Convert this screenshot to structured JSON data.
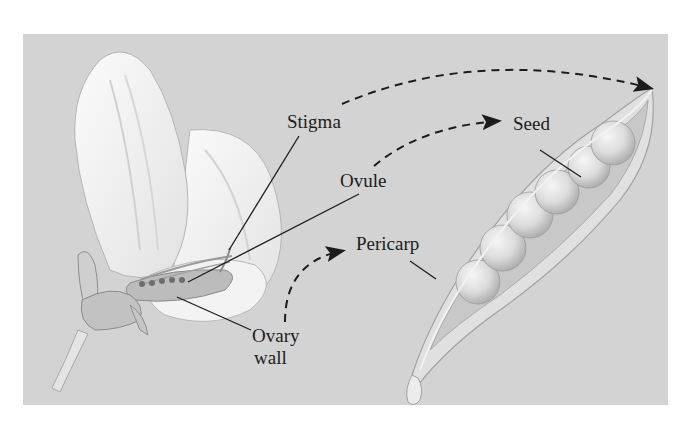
{
  "figure": {
    "background_color": "#d3d3d3",
    "line_color": "#1c1c1c",
    "labels": {
      "stigma": "Stigma",
      "ovule": "Ovule",
      "ovary_wall_line1": "Ovary",
      "ovary_wall_line2": "wall",
      "seed": "Seed",
      "pericarp": "Pericarp"
    },
    "illustrations": {
      "left": "flower-cutaway",
      "right": "open-pea-pod"
    },
    "arrows": [
      {
        "from": "stigma",
        "to": "pod-tip",
        "style": "dashed"
      },
      {
        "from": "ovule",
        "to": "seed",
        "style": "dashed"
      },
      {
        "from": "ovary_wall",
        "to": "pericarp",
        "style": "dashed"
      }
    ]
  }
}
